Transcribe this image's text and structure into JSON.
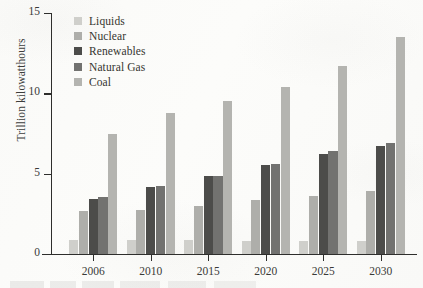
{
  "chart_data": {
    "type": "bar",
    "title": "",
    "xlabel": "",
    "ylabel": "Trillion kilowatthours",
    "categories": [
      "2006",
      "2010",
      "2015",
      "2020",
      "2025",
      "2030"
    ],
    "ylim": [
      0,
      15
    ],
    "yticks": [
      0,
      5,
      10,
      15
    ],
    "ytick_labels": [
      "0",
      "5",
      "10",
      "15"
    ],
    "grid": false,
    "legend_position": "top-left inside plot",
    "series": [
      {
        "name": "Liquids",
        "color": "#cfcfcb",
        "values": [
          0.85,
          0.85,
          0.9,
          0.8,
          0.8,
          0.8
        ]
      },
      {
        "name": "Nuclear",
        "color": "#aeaeaa",
        "values": [
          2.65,
          2.75,
          3.0,
          3.35,
          3.6,
          3.9
        ]
      },
      {
        "name": "Renewables",
        "color": "#4c4c4a",
        "values": [
          3.4,
          4.15,
          4.85,
          5.55,
          6.2,
          6.7
        ]
      },
      {
        "name": "Natural Gas",
        "color": "#727270",
        "values": [
          3.55,
          4.25,
          4.85,
          5.6,
          6.4,
          6.9
        ]
      },
      {
        "name": "Coal",
        "color": "#b4b4b0",
        "values": [
          7.45,
          8.75,
          9.55,
          10.4,
          11.7,
          13.5
        ]
      }
    ]
  }
}
